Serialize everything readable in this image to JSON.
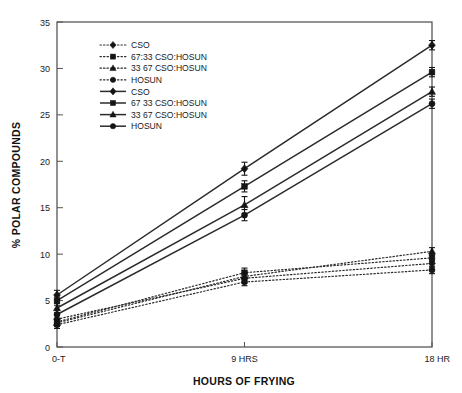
{
  "chart_data": {
    "type": "line",
    "title": "",
    "xlabel": "HOURS OF FRYING",
    "ylabel": "% POLAR COMPOUNDS",
    "categories": [
      "0-T",
      "9 HRS",
      "18 HR"
    ],
    "x": [
      0,
      9,
      18
    ],
    "ylim": [
      0,
      35
    ],
    "yticks": [
      0,
      5,
      10,
      15,
      20,
      25,
      30,
      35
    ],
    "ytick_labels": [
      "0",
      "5",
      "10",
      "15",
      "20",
      "25",
      "30",
      "35"
    ],
    "grid": false,
    "legend_position": "upper-left-inside",
    "series": [
      {
        "name": "CSO",
        "style": "dotted",
        "marker": "diamond",
        "values": [
          3.0,
          7.4,
          9.0
        ],
        "errors": [
          0.4,
          0.5,
          0.4
        ]
      },
      {
        "name": "67:33 CSO:HOSUN",
        "style": "dotted",
        "marker": "square",
        "values": [
          2.7,
          8.0,
          9.6
        ],
        "errors": [
          0.4,
          0.5,
          0.4
        ]
      },
      {
        "name": "33 67 CSO:HOSUN",
        "style": "dotted",
        "marker": "triangle",
        "values": [
          2.6,
          7.6,
          10.3
        ],
        "errors": [
          0.4,
          0.4,
          0.4
        ]
      },
      {
        "name": "HOSUN",
        "style": "dotted",
        "marker": "circle",
        "values": [
          2.4,
          7.0,
          8.3
        ],
        "errors": [
          0.4,
          0.4,
          0.4
        ]
      },
      {
        "name": "CSO",
        "style": "solid",
        "marker": "diamond",
        "values": [
          5.6,
          19.2,
          32.5
        ],
        "errors": [
          0.5,
          0.7,
          0.5
        ]
      },
      {
        "name": "67 33 CSO:HOSUN",
        "style": "solid",
        "marker": "square",
        "values": [
          5.0,
          17.3,
          29.6
        ],
        "errors": [
          0.5,
          0.6,
          0.5
        ]
      },
      {
        "name": "33 67 CSO:HOSUN",
        "style": "solid",
        "marker": "triangle",
        "values": [
          4.2,
          15.3,
          27.5
        ],
        "errors": [
          0.5,
          0.9,
          0.5
        ]
      },
      {
        "name": "HOSUN",
        "style": "solid",
        "marker": "circle",
        "values": [
          3.5,
          14.2,
          26.2
        ],
        "errors": [
          0.5,
          0.6,
          0.5
        ]
      }
    ],
    "legend": [
      {
        "label": "CSO",
        "style": "dotted",
        "marker": "diamond"
      },
      {
        "label": "67:33 CSO:HOSUN",
        "style": "dotted",
        "marker": "square"
      },
      {
        "label": "33 67 CSO:HOSUN",
        "style": "dotted",
        "marker": "triangle"
      },
      {
        "label": "HOSUN",
        "style": "dotted",
        "marker": "circle"
      },
      {
        "label": "CSO",
        "style": "solid",
        "marker": "diamond"
      },
      {
        "label": "67 33 CSO:HOSUN",
        "style": "solid",
        "marker": "square"
      },
      {
        "label": "33 67 CSO:HOSUN",
        "style": "solid",
        "marker": "triangle"
      },
      {
        "label": "HOSUN",
        "style": "solid",
        "marker": "circle"
      }
    ]
  }
}
